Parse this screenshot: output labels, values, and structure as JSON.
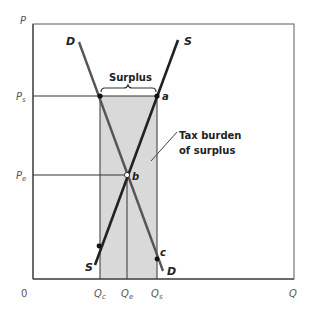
{
  "diagram": {
    "type": "supply-demand price floor surplus",
    "axes": {
      "y_label": "P",
      "x_label": "Q",
      "origin_label": "0"
    },
    "price_levels": [
      {
        "id": "ps",
        "label": "P",
        "subscript": "s"
      },
      {
        "id": "pe",
        "label": "P",
        "subscript": "e"
      }
    ],
    "quantity_levels": [
      {
        "id": "qc",
        "label": "Q",
        "subscript": "c"
      },
      {
        "id": "qe",
        "label": "Q",
        "subscript": "e"
      },
      {
        "id": "qs",
        "label": "Q",
        "subscript": "s"
      }
    ],
    "curves": {
      "demand_top_label": "D",
      "demand_bottom_label": "D",
      "supply_top_label": "S",
      "supply_bottom_label": "S"
    },
    "points": {
      "a": "a",
      "b": "b",
      "c": "c"
    },
    "annotations": {
      "surplus": "Surplus",
      "tax_burden_line1": "Tax burden",
      "tax_burden_line2": "of surplus"
    },
    "colors": {
      "shaded_area": "#d9d9d9",
      "supply_line": "#222222",
      "demand_line": "#555555",
      "axis": "#666666",
      "guide_lines": "#333333"
    }
  }
}
